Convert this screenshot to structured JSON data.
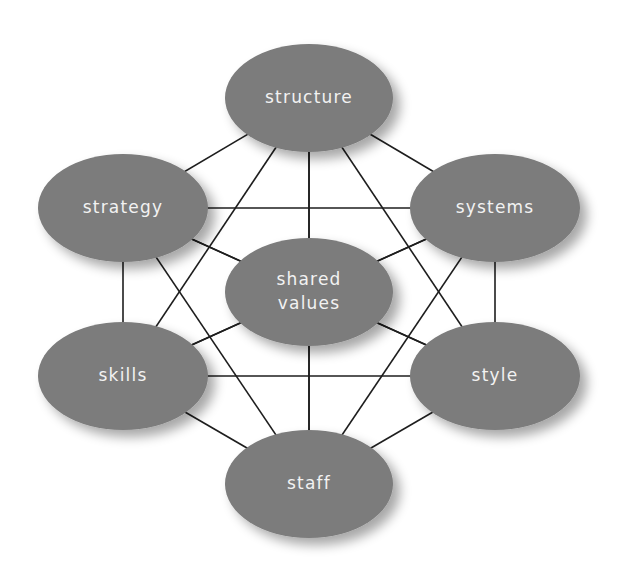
{
  "diagram": {
    "style": {
      "node_fill": "#7b7b7b",
      "label_color": "#f2f2f2",
      "edge_color": "#1e1e1e",
      "background": "#ffffff"
    },
    "nodes": [
      {
        "id": "structure",
        "lines": [
          "structure"
        ],
        "cx": 309,
        "cy": 98,
        "rx": 84,
        "ry": 54
      },
      {
        "id": "strategy",
        "lines": [
          "strategy"
        ],
        "cx": 123,
        "cy": 208,
        "rx": 85,
        "ry": 54
      },
      {
        "id": "systems",
        "lines": [
          "systems"
        ],
        "cx": 495,
        "cy": 208,
        "rx": 85,
        "ry": 54
      },
      {
        "id": "shared-values",
        "lines": [
          "shared",
          "values"
        ],
        "cx": 309,
        "cy": 292,
        "rx": 84,
        "ry": 54
      },
      {
        "id": "skills",
        "lines": [
          "skills"
        ],
        "cx": 123,
        "cy": 376,
        "rx": 85,
        "ry": 54
      },
      {
        "id": "style",
        "lines": [
          "style"
        ],
        "cx": 495,
        "cy": 376,
        "rx": 85,
        "ry": 54
      },
      {
        "id": "staff",
        "lines": [
          "staff"
        ],
        "cx": 309,
        "cy": 484,
        "rx": 84,
        "ry": 54
      }
    ],
    "edges": "complete-graph"
  }
}
